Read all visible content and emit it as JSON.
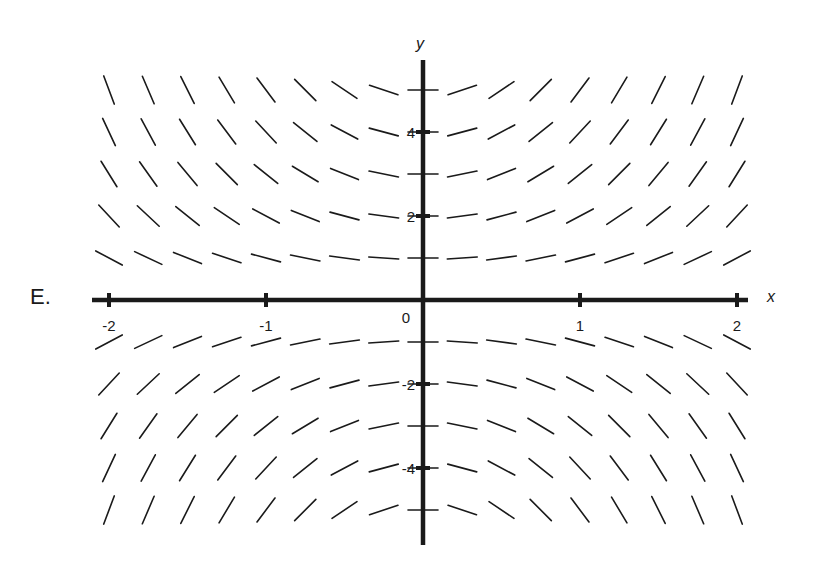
{
  "panel_label": "E.",
  "chart_data": {
    "type": "slope_field",
    "title": "",
    "panel_label": "E.",
    "differential_equation": "dy/dx = x*y",
    "xlabel": "x",
    "ylabel": "y",
    "xlim": [
      -2,
      2
    ],
    "ylim": [
      -5.5,
      5.5
    ],
    "x_ticks": [
      -2,
      -1,
      0,
      1,
      2
    ],
    "x_tick_labels": [
      "-2",
      "-1",
      "0",
      "1",
      "2"
    ],
    "y_ticks": [
      -4,
      -2,
      2,
      4
    ],
    "y_tick_labels": [
      "-4",
      "-2",
      "2",
      "4"
    ],
    "grid": false,
    "sample_x": [
      -2,
      -1.75,
      -1.5,
      -1.25,
      -1,
      -0.75,
      -0.5,
      -0.25,
      0,
      0.25,
      0.5,
      0.75,
      1,
      1.25,
      1.5,
      1.75,
      2
    ],
    "sample_y": [
      5,
      4,
      3,
      2,
      1,
      -1,
      -2,
      -3,
      -4,
      -5
    ],
    "slope_rule": "slope at (x,y) equals x times y; segments drawn at fixed length, positive where x and y share sign, negative otherwise, horizontal at x=0"
  },
  "colors": {
    "ink": "#1a1a1a",
    "background": "#ffffff"
  }
}
